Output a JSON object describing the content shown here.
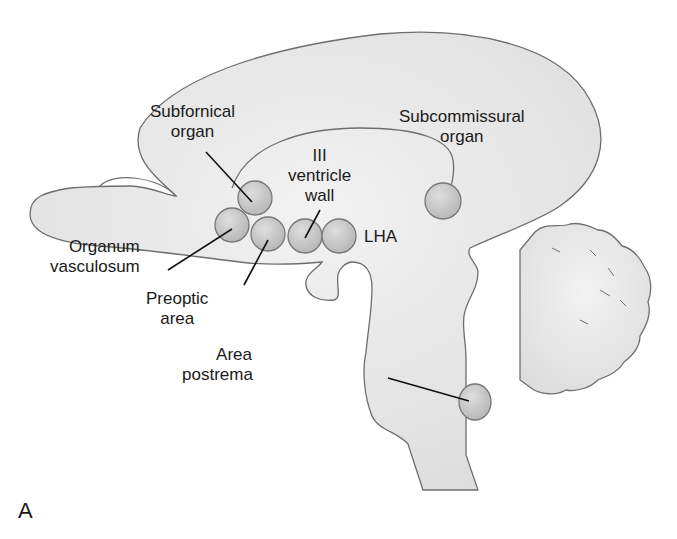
{
  "figure": {
    "panel_letter": "A",
    "colors": {
      "tissue_fill": "#e6e6e6",
      "tissue_stroke": "#6e6e6e",
      "organ_fill": "#c9c9c9",
      "organ_stroke": "#777777",
      "leader_line": "#111111",
      "text": "#1a1a1a"
    },
    "labels": {
      "subfornical": {
        "line1": "Subfornical",
        "line2": "organ"
      },
      "subcommissural": {
        "line1": "Subcommissural",
        "line2": "organ"
      },
      "third_ventricle": {
        "line1": "III",
        "line2": "ventricle",
        "line3": "wall"
      },
      "lha": {
        "line1": "LHA"
      },
      "organum": {
        "line1": "Organum",
        "line2": "vasculosum"
      },
      "preoptic": {
        "line1": "Preoptic",
        "line2": "area"
      },
      "area_postrema": {
        "line1": "Area",
        "line2": "postrema"
      }
    }
  }
}
